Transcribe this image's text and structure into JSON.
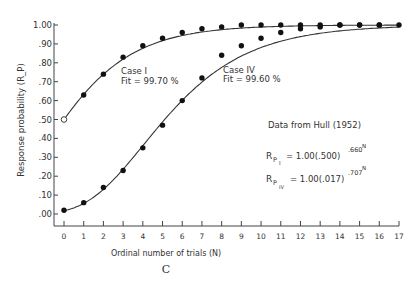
{
  "chart_data": {
    "type": "scatter",
    "title": "",
    "panel_label": "C",
    "xlabel": "Ordinal number of trials (N)",
    "ylabel": "Response probability (R_P)",
    "xlim": [
      0,
      17
    ],
    "ylim": [
      0.0,
      1.0
    ],
    "x_ticks": [
      0,
      1,
      2,
      3,
      4,
      5,
      6,
      7,
      8,
      9,
      10,
      11,
      12,
      13,
      14,
      15,
      16,
      17
    ],
    "y_tick_labels": [
      ".00",
      ".10",
      ".20",
      ".30",
      ".40",
      ".50",
      ".60",
      ".70",
      ".80",
      ".90",
      "1.00"
    ],
    "grid": false,
    "series": [
      {
        "name": "Case I",
        "fit_label": "Fit = 99.70 %",
        "x": [
          0,
          1,
          2,
          3,
          4,
          5,
          6,
          7,
          8,
          9,
          10,
          11,
          12,
          13,
          14,
          15,
          16
        ],
        "values": [
          0.5,
          0.63,
          0.74,
          0.83,
          0.89,
          0.93,
          0.96,
          0.98,
          0.99,
          1.0,
          1.0,
          1.0,
          1.0,
          1.0,
          1.0,
          1.0,
          1.0
        ],
        "first_point_open": true,
        "model": {
          "a": 1.0,
          "b": 0.5,
          "c": 0.66
        }
      },
      {
        "name": "Case IV",
        "fit_label": "Fit = 99.60 %",
        "x": [
          0,
          1,
          2,
          3,
          4,
          5,
          6,
          7,
          8,
          9,
          10,
          11,
          12,
          13,
          14,
          15,
          16,
          17
        ],
        "values": [
          0.02,
          0.06,
          0.14,
          0.23,
          0.35,
          0.47,
          0.6,
          0.72,
          0.84,
          0.89,
          0.93,
          0.96,
          0.98,
          0.99,
          1.0,
          1.0,
          1.0,
          1.0
        ],
        "first_point_open": false,
        "model": {
          "a": 1.0,
          "b": 0.017,
          "c": 0.707
        }
      }
    ],
    "annotations": {
      "case1_label": "Case I",
      "case1_fit": "Fit = 99.70 %",
      "case4_label": "Case IV",
      "case4_fit": "Fit = 99.60 %",
      "source": "Data from Hull (1952)",
      "eq1_lhs": "R",
      "eq1_sub": "P",
      "eq1_subsub": "I",
      "eq1_rhs": "= 1.00(.500)",
      "eq1_exp": ".660",
      "eq1_expsup": "N",
      "eq2_lhs": "R",
      "eq2_sub": "P",
      "eq2_subsub": "IV",
      "eq2_rhs": "= 1.00(.017)",
      "eq2_exp": ".707",
      "eq2_expsup": "N"
    }
  }
}
